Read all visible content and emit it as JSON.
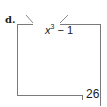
{
  "problem": {
    "label": "d.",
    "rule": {
      "variable": "x",
      "exponent": "3",
      "rest": " − 1"
    },
    "output_value": "26"
  },
  "colors": {
    "line": "#7a7a7a",
    "text": "#1a1a1a"
  }
}
